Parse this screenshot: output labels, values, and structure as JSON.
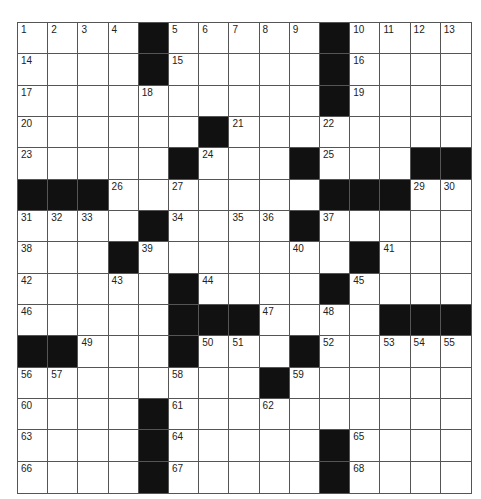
{
  "puzzle": {
    "rows": 15,
    "cols": 15,
    "colors": {
      "block": "#111111",
      "cell": "#ffffff",
      "gridline": "#555555",
      "number": "#222222"
    },
    "grid": [
      "....#.....#....",
      "....#.....#....",
      "..........#....",
      "......#........",
      ".....#...#...##",
      "###.......###..",
      "....#....#.....",
      "...#.......#...",
      ".....#....#....",
      ".....###....###",
      "##...#...#.....",
      "........#......",
      "....#..........",
      "....#.....#....",
      "....#.....#...."
    ],
    "numbers": [
      [
        1,
        2,
        3,
        4,
        0,
        5,
        6,
        7,
        8,
        9,
        0,
        10,
        11,
        12,
        13
      ],
      [
        14,
        0,
        0,
        0,
        0,
        15,
        0,
        0,
        0,
        0,
        0,
        16,
        0,
        0,
        0
      ],
      [
        17,
        0,
        0,
        0,
        18,
        0,
        0,
        0,
        0,
        0,
        0,
        19,
        0,
        0,
        0
      ],
      [
        20,
        0,
        0,
        0,
        0,
        0,
        0,
        21,
        0,
        0,
        22,
        0,
        0,
        0,
        0
      ],
      [
        23,
        0,
        0,
        0,
        0,
        0,
        24,
        0,
        0,
        0,
        25,
        0,
        0,
        0,
        0
      ],
      [
        0,
        0,
        0,
        26,
        0,
        27,
        0,
        0,
        0,
        0,
        28,
        0,
        0,
        29,
        30
      ],
      [
        31,
        32,
        33,
        0,
        0,
        34,
        0,
        35,
        36,
        0,
        37,
        0,
        0,
        0,
        0
      ],
      [
        38,
        0,
        0,
        0,
        39,
        0,
        0,
        0,
        0,
        40,
        0,
        0,
        41,
        0,
        0
      ],
      [
        42,
        0,
        0,
        43,
        0,
        0,
        44,
        0,
        0,
        0,
        0,
        45,
        0,
        0,
        0
      ],
      [
        46,
        0,
        0,
        0,
        0,
        0,
        0,
        0,
        47,
        0,
        48,
        0,
        0,
        0,
        0
      ],
      [
        0,
        0,
        49,
        0,
        0,
        0,
        50,
        51,
        0,
        0,
        52,
        0,
        53,
        54,
        55
      ],
      [
        56,
        57,
        0,
        0,
        0,
        58,
        0,
        0,
        0,
        59,
        0,
        0,
        0,
        0,
        0
      ],
      [
        60,
        0,
        0,
        0,
        0,
        61,
        0,
        0,
        62,
        0,
        0,
        0,
        0,
        0,
        0
      ],
      [
        63,
        0,
        0,
        0,
        0,
        64,
        0,
        0,
        0,
        0,
        0,
        65,
        0,
        0,
        0
      ],
      [
        66,
        0,
        0,
        0,
        0,
        67,
        0,
        0,
        0,
        0,
        0,
        68,
        0,
        0,
        0
      ]
    ],
    "letters": []
  }
}
